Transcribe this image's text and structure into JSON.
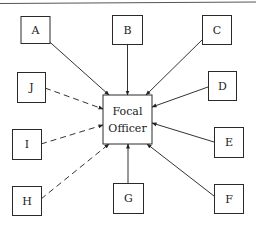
{
  "diagram": {
    "type": "hub-and-spoke communication network",
    "center": {
      "id": "focal",
      "label_line1": "Focal",
      "label_line2": "Officer"
    },
    "nodes": [
      {
        "id": "A",
        "label": "A",
        "connection": "solid"
      },
      {
        "id": "B",
        "label": "B",
        "connection": "solid"
      },
      {
        "id": "C",
        "label": "C",
        "connection": "solid"
      },
      {
        "id": "D",
        "label": "D",
        "connection": "solid"
      },
      {
        "id": "E",
        "label": "E",
        "connection": "solid"
      },
      {
        "id": "F",
        "label": "F",
        "connection": "solid"
      },
      {
        "id": "G",
        "label": "G",
        "connection": "solid"
      },
      {
        "id": "H",
        "label": "H",
        "connection": "dashed"
      },
      {
        "id": "I",
        "label": "I",
        "connection": "dashed"
      },
      {
        "id": "J",
        "label": "J",
        "connection": "dashed"
      }
    ],
    "edges": [
      {
        "from": "A",
        "to": "focal",
        "style": "solid",
        "arrow": "to-focal"
      },
      {
        "from": "B",
        "to": "focal",
        "style": "solid",
        "arrow": "to-focal"
      },
      {
        "from": "C",
        "to": "focal",
        "style": "solid",
        "arrow": "to-focal"
      },
      {
        "from": "D",
        "to": "focal",
        "style": "solid",
        "arrow": "to-focal"
      },
      {
        "from": "E",
        "to": "focal",
        "style": "solid",
        "arrow": "to-focal"
      },
      {
        "from": "F",
        "to": "focal",
        "style": "solid",
        "arrow": "to-focal"
      },
      {
        "from": "G",
        "to": "focal",
        "style": "solid",
        "arrow": "to-focal"
      },
      {
        "from": "H",
        "to": "focal",
        "style": "dashed",
        "arrow": "to-focal"
      },
      {
        "from": "I",
        "to": "focal",
        "style": "dashed",
        "arrow": "to-focal"
      },
      {
        "from": "J",
        "to": "focal",
        "style": "dashed",
        "arrow": "to-focal"
      }
    ]
  },
  "colors": {
    "stroke": "#2a2a2a",
    "background": "#ffffff"
  }
}
